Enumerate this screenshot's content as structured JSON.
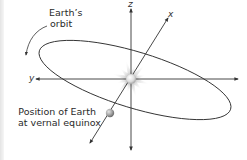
{
  "diagram": {
    "type": "celestial-coordinate-diagram",
    "axes": {
      "x_label": "x",
      "y_label": "y",
      "z_label": "z"
    },
    "labels": {
      "orbit_line1": "Earth’s",
      "orbit_line2": "orbit",
      "earth_line1": "Position of Earth",
      "earth_line2": "at vernal equinox"
    },
    "objects": {
      "center": "sun",
      "orbiting": "earth"
    },
    "colors": {
      "line": "#333333",
      "sun_glow": "#c8c8c8",
      "sun_body": "#e8e8e8",
      "earth_body": "#9a9a9a"
    }
  }
}
